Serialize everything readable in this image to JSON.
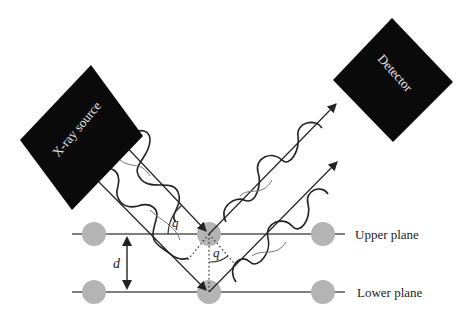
{
  "diagram": {
    "source_label": "X-ray source",
    "detector_label": "Detector",
    "upper_plane_label": "Upper plane",
    "lower_plane_label": "Lower plane",
    "spacing_label": "d",
    "angle_label_incident": "q",
    "angle_label_path": "q"
  },
  "colors": {
    "box": "#0a0a0a",
    "atom": "#b4b4b4",
    "line": "#333333",
    "text": "#222222"
  }
}
